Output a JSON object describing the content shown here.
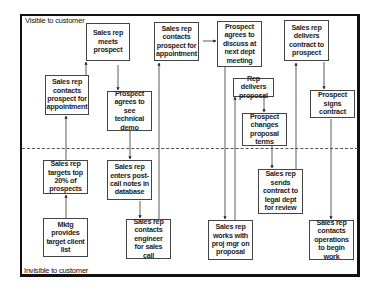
{
  "zones": {
    "visible_label": "Visible to customer",
    "invisible_label": "Invisible to customer"
  },
  "steps": [
    {
      "id": "mktg-list",
      "label": "Mktg provides target client list",
      "zone": "invisible"
    },
    {
      "id": "target-top",
      "label": "Sales rep targets top 20% of prospects",
      "zone": "invisible"
    },
    {
      "id": "contact-appt-1",
      "label": "Sales rep contacts prospect for appointment",
      "zone": "visible"
    },
    {
      "id": "meets-prospect",
      "label": "Sales rep meets prospect",
      "zone": "visible"
    },
    {
      "id": "agrees-demo",
      "label": "Prospect agrees to see technical demo",
      "zone": "visible"
    },
    {
      "id": "post-call-notes",
      "label": "Sales rep enters post-call notes in database",
      "zone": "invisible"
    },
    {
      "id": "contacts-engineer",
      "label": "Sales rep contacts engineer for sales call",
      "zone": "invisible"
    },
    {
      "id": "contact-appt-2",
      "label": "Sales rep contacts prospect for appointment",
      "zone": "visible"
    },
    {
      "id": "agrees-discuss",
      "label": "Prospect agrees to discuss at next dept meeting",
      "zone": "visible"
    },
    {
      "id": "works-proj-mgr",
      "label": "Sales rep works with proj mgr on proposal",
      "zone": "invisible"
    },
    {
      "id": "delivers-proposal",
      "label": "Rep delivers proposal",
      "zone": "visible"
    },
    {
      "id": "changes-terms",
      "label": "Prospect changes proposal terms",
      "zone": "visible"
    },
    {
      "id": "sends-legal",
      "label": "Sales rep sends contract to legal dept for review",
      "zone": "invisible"
    },
    {
      "id": "delivers-contract",
      "label": "Sales rep delivers contract to prospect",
      "zone": "visible"
    },
    {
      "id": "signs-contract",
      "label": "Prospect signs contract",
      "zone": "visible"
    },
    {
      "id": "contacts-operations",
      "label": "Sales rep contacts operations to begin work",
      "zone": "invisible"
    }
  ],
  "flows": [
    [
      "mktg-list",
      "target-top"
    ],
    [
      "target-top",
      "contact-appt-1"
    ],
    [
      "contact-appt-1",
      "meets-prospect"
    ],
    [
      "meets-prospect",
      "agrees-demo"
    ],
    [
      "agrees-demo",
      "post-call-notes"
    ],
    [
      "post-call-notes",
      "contacts-engineer"
    ],
    [
      "contacts-engineer",
      "contact-appt-2"
    ],
    [
      "contact-appt-2",
      "agrees-discuss"
    ],
    [
      "agrees-discuss",
      "works-proj-mgr"
    ],
    [
      "works-proj-mgr",
      "delivers-proposal"
    ],
    [
      "delivers-proposal",
      "changes-terms"
    ],
    [
      "changes-terms",
      "sends-legal"
    ],
    [
      "sends-legal",
      "delivers-contract"
    ],
    [
      "delivers-contract",
      "signs-contract"
    ],
    [
      "signs-contract",
      "contacts-operations"
    ]
  ]
}
